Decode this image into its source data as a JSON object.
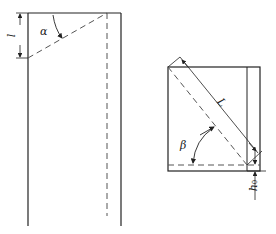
{
  "labels": {
    "l": "l",
    "alpha": "α",
    "L": "L",
    "beta": "β",
    "h0_main": "h",
    "h0_sub": "0"
  },
  "colors": {
    "line": "#222222",
    "dashed": "#555555",
    "background": "#ffffff"
  }
}
